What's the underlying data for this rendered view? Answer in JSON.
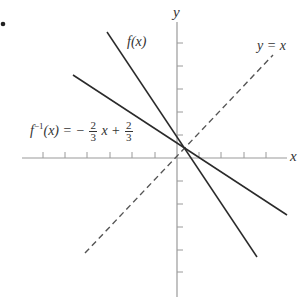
{
  "figure": {
    "bullet": "•",
    "axes": {
      "x_label": "x",
      "y_label": "y"
    },
    "lines": [
      {
        "name": "f(x)",
        "label": "f(x)",
        "style": "solid"
      },
      {
        "name": "f-inverse",
        "label_prefix": "f",
        "label_sup": "−1",
        "label_mid": "(x) = −",
        "frac1_num": "2",
        "frac1_den": "3",
        "label_x": "x +",
        "frac2_num": "2",
        "frac2_den": "3",
        "style": "solid"
      },
      {
        "name": "identity",
        "label": "y = x",
        "style": "dashed"
      }
    ],
    "colors": {
      "axis": "#9a9a9a",
      "line": "#2a2a2a",
      "dashed": "#555555"
    }
  }
}
